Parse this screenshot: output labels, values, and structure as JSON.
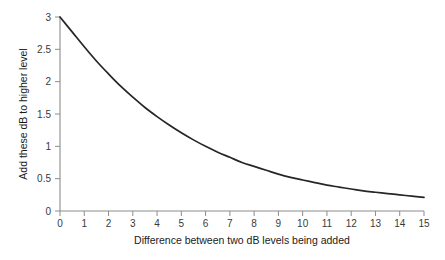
{
  "chart_data": {
    "type": "line",
    "title": "",
    "subtitle": "",
    "xlabel": "Difference between two dB levels being added",
    "ylabel": "Add these dB to higher level",
    "xlim": [
      0,
      15
    ],
    "ylim": [
      0,
      3
    ],
    "grid": false,
    "legend": null,
    "legend_position": "none",
    "xticks": [
      "0",
      "1",
      "2",
      "3",
      "4",
      "5",
      "6",
      "7",
      "8",
      "9",
      "10",
      "11",
      "12",
      "13",
      "14",
      "15"
    ],
    "yticks": [
      "0",
      "0.5",
      "1",
      "1.5",
      "2",
      "2.5",
      "3"
    ],
    "x": [
      0,
      0.5,
      1,
      1.5,
      2,
      2.5,
      3,
      3.5,
      4,
      4.5,
      5,
      5.5,
      6,
      6.5,
      7,
      7.5,
      8,
      8.5,
      9,
      9.5,
      10,
      10.5,
      11,
      11.5,
      12,
      12.5,
      13,
      13.5,
      14,
      14.5,
      15
    ],
    "series": [
      {
        "name": "dB addition correction",
        "color": "#262626",
        "values": [
          3.0,
          2.77,
          2.54,
          2.32,
          2.12,
          1.93,
          1.76,
          1.6,
          1.46,
          1.33,
          1.21,
          1.1,
          1.0,
          0.91,
          0.83,
          0.75,
          0.69,
          0.63,
          0.57,
          0.52,
          0.48,
          0.44,
          0.4,
          0.37,
          0.34,
          0.31,
          0.29,
          0.27,
          0.25,
          0.23,
          0.21
        ]
      }
    ],
    "axis_color": "#8c8c8c",
    "curve_color": "#262626",
    "background": "#ffffff"
  },
  "axes": {
    "x_title": "Difference between two dB levels being added",
    "y_title": "Add these dB to higher level",
    "x_tick_labels": [
      "0",
      "1",
      "2",
      "3",
      "4",
      "5",
      "6",
      "7",
      "8",
      "9",
      "10",
      "11",
      "12",
      "13",
      "14",
      "15"
    ],
    "y_tick_labels": [
      "0",
      "0.5",
      "1",
      "1.5",
      "2",
      "2.5",
      "3"
    ]
  }
}
